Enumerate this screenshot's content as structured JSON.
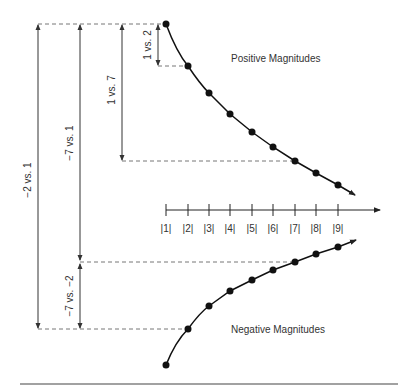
{
  "diagram": {
    "positive_label": "Positive Magnitudes",
    "negative_label": "Negative Magnitudes",
    "axis_ticks": [
      "|1|",
      "|2|",
      "|3|",
      "|4|",
      "|5|",
      "|6|",
      "|7|",
      "|8|",
      "|9|"
    ],
    "comparisons": [
      {
        "label": "1 vs. 2"
      },
      {
        "label": "1 vs. 7"
      },
      {
        "label": "−7 vs. 1"
      },
      {
        "label": "−2 vs. 1"
      },
      {
        "label": "−7 vs. −2"
      }
    ],
    "colors": {
      "curve": "#111111",
      "guide": "#666666",
      "text": "#333333"
    }
  }
}
